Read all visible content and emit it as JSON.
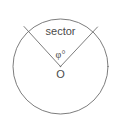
{
  "figure": {
    "name": "circle-sector-diagram",
    "background_color": "#ffffff",
    "stroke_color": "#6e6e6e",
    "text_color": "#4a4a4a",
    "width": 122,
    "height": 134
  },
  "geometry": {
    "circle": {
      "center_x": 60.5,
      "center_y": 66.5,
      "radius": 47.5,
      "stroke_width": 0.9
    },
    "radius_left": {
      "x1": 60.5,
      "y1": 66.5,
      "x2": 24.0,
      "y2": 26.5,
      "stroke_width": 0.9
    },
    "radius_right": {
      "x1": 60.5,
      "y1": 66.5,
      "x2": 97.5,
      "y2": 27.0,
      "stroke_width": 0.9
    },
    "center_dot": {
      "x": 60.5,
      "y": 66.5,
      "r": 0.8
    }
  },
  "labels": {
    "sector": {
      "text": "sector",
      "x": 60.5,
      "y": 32,
      "font_size": 11
    },
    "angle": {
      "text": "φ°",
      "x": 60.5,
      "y": 56,
      "font_size": 10
    },
    "center_point": {
      "text": "O",
      "x": 60.5,
      "y": 75,
      "font_size": 11
    }
  }
}
